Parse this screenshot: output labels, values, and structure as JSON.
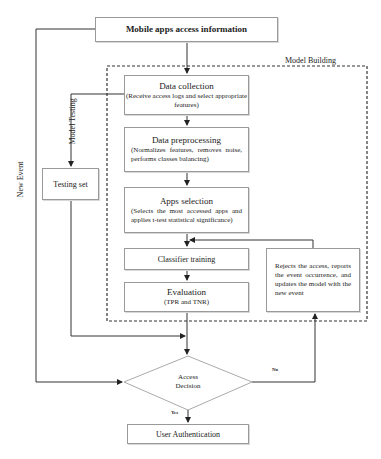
{
  "diagram": {
    "top_box": "Mobile apps access information",
    "model_building_label": "Model Building",
    "data_collection": {
      "title": "Data collection",
      "sub": "(Receive access logs and select appropriate features)"
    },
    "data_preprocessing": {
      "title": "Data preprocessing",
      "sub": "(Normalizes features, removes noise, performs classes balancing)"
    },
    "apps_selection": {
      "title": "Apps selection",
      "sub": "(Selects the most accessed apps and applies t-test statistical significance)"
    },
    "classifier_training": "Classifier training",
    "evaluation": {
      "title": "Evaluation",
      "sub": "(TPR and TNR)"
    },
    "rejects": "Rejects the access, reports the event occurrence, and updates the model with the new event",
    "testing_set": "Testing set",
    "model_testing_label": "Model Testing",
    "new_event_label": "New Event",
    "decision": {
      "line1": "Access",
      "line2": "Decision"
    },
    "yes_label": "Yes",
    "no_label": "No",
    "user_auth": "User Authentication"
  }
}
